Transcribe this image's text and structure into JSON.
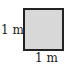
{
  "diagram": {
    "shape": "square",
    "fill_color": "#d8d8d8",
    "border_color": "#222222",
    "labels": {
      "left_side": "1 m",
      "bottom_side": "1 m"
    }
  }
}
